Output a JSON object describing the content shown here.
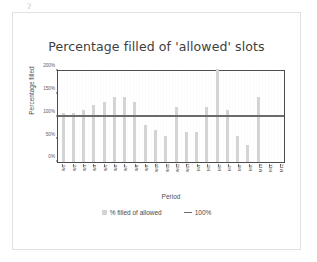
{
  "page": {
    "artifact_mark": "ʔ"
  },
  "chart": {
    "title": "Percentage filled of 'allowed' slots",
    "x_axis_title": "Period",
    "y_axis_title": "Percentage filled",
    "legend": [
      {
        "label": "% filled of allowed",
        "swatch": "bar-swatch",
        "color": "#d4d4d4"
      },
      {
        "label": "100%",
        "swatch": "line-swatch",
        "color": "#6b6b6b"
      }
    ],
    "colors": {
      "bar": "#d4d4d4",
      "reference_line": "#6b6b6b",
      "axis": "#4d4d4d",
      "text": "#4a4a4a",
      "frame": "#e2e2e2",
      "background": "#ffffff"
    }
  },
  "chart_data": {
    "type": "bar",
    "title": "Percentage filled of 'allowed' slots",
    "xlabel": "Period",
    "ylabel": "Percentage filled",
    "ylim": [
      0,
      200
    ],
    "ytick_labels": [
      "0%",
      "50%",
      "100%",
      "150%",
      "200%"
    ],
    "ytick_values": [
      0,
      50,
      100,
      150,
      200
    ],
    "grid": false,
    "legend_position": "bottom",
    "categories": [
      "W1",
      "W2",
      "W3",
      "W4",
      "W5",
      "W6",
      "W7",
      "W8",
      "W9",
      "W10",
      "W11",
      "W12",
      "W13",
      "M4",
      "M5",
      "M6",
      "M7",
      "M8",
      "M9",
      "M10",
      "M11",
      "M12"
    ],
    "series": [
      {
        "name": "% filled of allowed",
        "type": "bar",
        "color": "#d4d4d4",
        "values": [
          108,
          107,
          115,
          125,
          131,
          143,
          143,
          133,
          82,
          70,
          57,
          120,
          67,
          65,
          120,
          205,
          114,
          57,
          37,
          142,
          0,
          0
        ]
      },
      {
        "name": "100%",
        "type": "line",
        "color": "#6b6b6b",
        "constant_value": 100
      }
    ],
    "annotations": [
      "Bar for M5 exceeds the 200% axis maximum",
      "No bars plotted for M11 and M12"
    ]
  }
}
